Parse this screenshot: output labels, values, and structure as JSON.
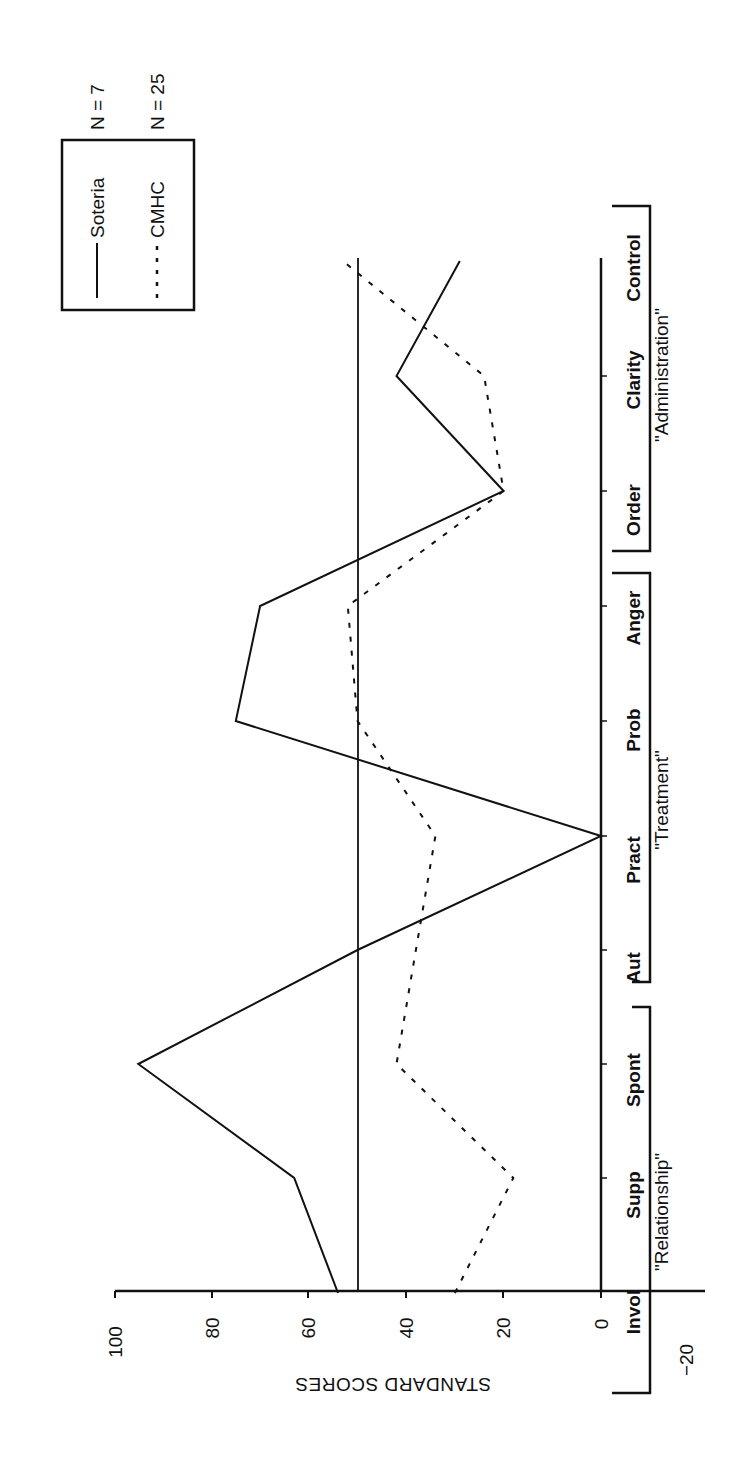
{
  "chart_data": {
    "type": "line",
    "orientation": "rotated-90-ccw",
    "title": "",
    "xlabel": "",
    "ylabel": "STANDARD SCORES",
    "ylim": [
      -20,
      100
    ],
    "yticks": [
      100,
      80,
      60,
      40,
      20,
      0,
      -20
    ],
    "reference_line": 50,
    "categories": [
      "Invol",
      "Supp",
      "Spont",
      "Aut",
      "Pract",
      "Prob",
      "Anger",
      "Order",
      "Clarity",
      "Control"
    ],
    "groups": [
      {
        "label": "\"Relationship\"",
        "categories": [
          "Invol",
          "Supp",
          "Spont"
        ]
      },
      {
        "label": "\"Treatment\"",
        "categories": [
          "Aut",
          "Pract",
          "Prob",
          "Anger"
        ]
      },
      {
        "label": "\"Administration\"",
        "categories": [
          "Order",
          "Clarity",
          "Control"
        ]
      }
    ],
    "series": [
      {
        "name": "Soteria",
        "n_label": "N = 7",
        "style": "solid",
        "values": [
          54,
          63,
          95,
          50,
          0,
          75,
          70,
          20,
          42,
          29
        ]
      },
      {
        "name": "CMHC",
        "n_label": "N = 25",
        "style": "dashed",
        "values": [
          30,
          18,
          42,
          38,
          34,
          50,
          52,
          20,
          24,
          53
        ]
      }
    ],
    "legend_position": "top-left (rotated)",
    "grid": false
  },
  "axis": {
    "title": "STANDARD SCORES",
    "ticks": [
      "100",
      "80",
      "60",
      "40",
      "20",
      "0",
      "−20"
    ]
  },
  "categories": [
    "Invol",
    "Supp",
    "Spont",
    "Aut",
    "Pract",
    "Prob",
    "Anger",
    "Order",
    "Clarity",
    "Control"
  ],
  "groups": [
    "\"Relationship\"",
    "\"Treatment\"",
    "\"Administration\""
  ],
  "legend": {
    "soteria": {
      "label": "Soteria",
      "n": "N = 7"
    },
    "cmhc": {
      "label": "CMHC",
      "n": "N = 25"
    }
  }
}
